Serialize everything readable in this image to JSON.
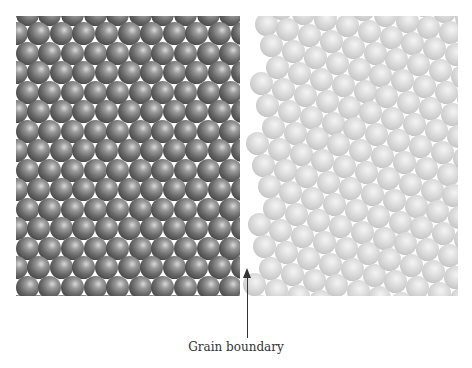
{
  "figure": {
    "annotation_label": "Grain boundary",
    "caption_partial": "",
    "left_grain": {
      "shade": "dark",
      "lattice": "hexagonal close-packed",
      "rotation_deg": 0,
      "sphere_diameter": 23,
      "spacing_x": 22.6,
      "spacing_y": 19.5
    },
    "right_grain": {
      "shade": "light",
      "lattice": "hexagonal close-packed",
      "rotation_deg": 15,
      "sphere_diameter": 23,
      "spacing": 22.6
    },
    "colors": {
      "dark_sphere": "#555555",
      "light_sphere": "#d0d0d0",
      "arrow": "#333333"
    }
  }
}
